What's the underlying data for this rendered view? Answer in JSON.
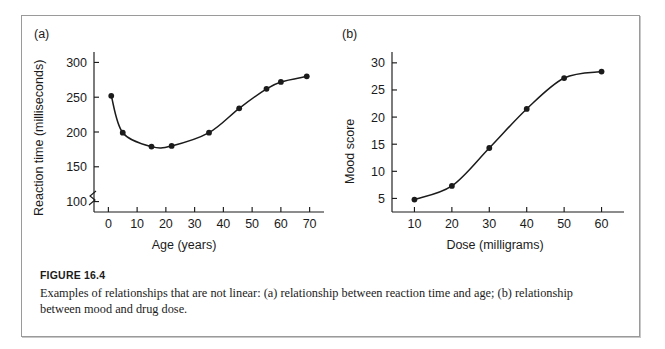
{
  "figure": {
    "caption_title": "FIGURE 16.4",
    "caption_text": "Examples of relationships that are not linear: (a) relationship between reaction time and age; (b) relationship between mood and drug dose."
  },
  "chart_data": [
    {
      "type": "line",
      "panel_label": "(a)",
      "title": "",
      "xlabel": "Age (years)",
      "ylabel": "Reaction time (milliseconds)",
      "x": [
        1,
        5,
        15,
        22,
        35,
        45.5,
        55,
        60,
        69
      ],
      "values": [
        252,
        199,
        179,
        180,
        199,
        234,
        262,
        272,
        280
      ],
      "xticks": [
        0,
        10,
        20,
        30,
        40,
        50,
        60,
        70
      ],
      "yticks": [
        100,
        150,
        200,
        250,
        300
      ],
      "xlim": [
        -5,
        75
      ],
      "ylim": [
        85,
        315
      ],
      "y_axis_break": true,
      "grid": false,
      "legend": "none",
      "markers": "filled-circle",
      "line_color": "#1b1b1b"
    },
    {
      "type": "line",
      "panel_label": "(b)",
      "title": "",
      "xlabel": "Dose (milligrams)",
      "ylabel": "Mood score",
      "x": [
        10,
        20,
        30,
        40,
        50,
        60
      ],
      "values": [
        4.8,
        7.3,
        14.3,
        21.5,
        27.2,
        28.4
      ],
      "xticks": [
        10,
        20,
        30,
        40,
        50,
        60
      ],
      "yticks": [
        5,
        10,
        15,
        20,
        25,
        30
      ],
      "xlim": [
        4,
        66
      ],
      "ylim": [
        2.5,
        32
      ],
      "y_axis_break": false,
      "grid": false,
      "legend": "none",
      "markers": "filled-circle",
      "line_color": "#1b1b1b"
    }
  ]
}
